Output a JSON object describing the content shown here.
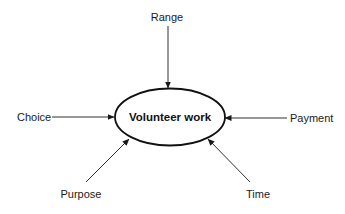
{
  "diagram": {
    "center": {
      "label": "Volunteer work"
    },
    "nodes": [
      {
        "id": "range",
        "label": "Range",
        "position": "top"
      },
      {
        "id": "choice",
        "label": "Choice",
        "position": "left"
      },
      {
        "id": "payment",
        "label": "Payment",
        "position": "right"
      },
      {
        "id": "purpose",
        "label": "Purpose",
        "position": "bottom-left"
      },
      {
        "id": "time",
        "label": "Time",
        "position": "bottom-right"
      }
    ],
    "edges": [
      {
        "from": "range",
        "to": "center"
      },
      {
        "from": "choice",
        "to": "center"
      },
      {
        "from": "payment",
        "to": "center"
      },
      {
        "from": "purpose",
        "to": "center"
      },
      {
        "from": "time",
        "to": "center"
      }
    ],
    "colors": {
      "stroke": "#1a1a1a",
      "background": "#ffffff"
    }
  }
}
